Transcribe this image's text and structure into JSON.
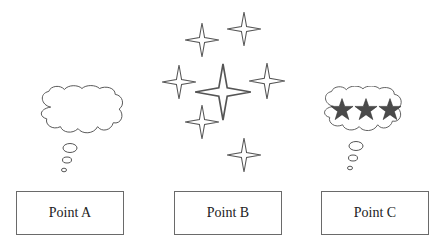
{
  "diagram": {
    "panels": [
      {
        "id": "A",
        "label": "Point A",
        "graphic": "empty-thought-bubble",
        "description": "Empty thought cloud"
      },
      {
        "id": "B",
        "label": "Point B",
        "graphic": "sparkle-stars",
        "description": "Seven four-pointed outline sparkles, one large in center"
      },
      {
        "id": "C",
        "label": "Point C",
        "graphic": "thought-bubble-three-stars",
        "description": "Thought cloud containing three filled five-pointed stars"
      }
    ],
    "colors": {
      "outline": "#555555",
      "star_fill": "#4a4a4a",
      "box_border": "#6a6a6a",
      "background": "#ffffff"
    }
  }
}
